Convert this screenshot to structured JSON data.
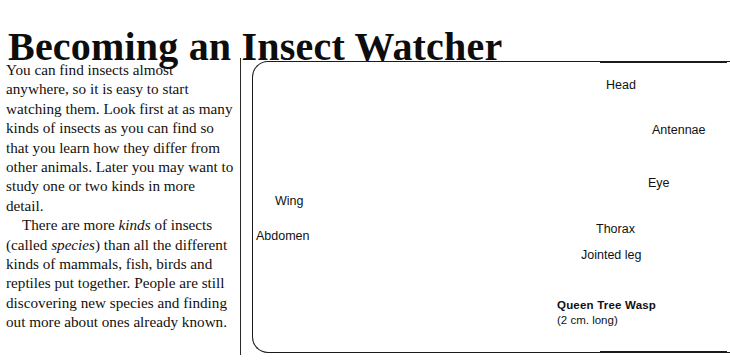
{
  "page": {
    "title": "Becoming an Insect Watcher",
    "background_color": "#ffffff",
    "ink_color": "#111111"
  },
  "article": {
    "paragraph_1_part_1": "You can find insects almost anywhere, so it is easy to start watching them. Look first at as many kinds of insects as you can find so that you learn how they differ from other animals. Later you may want to study one or two kinds in more detail.",
    "paragraph_2_part_1": "There are more ",
    "paragraph_2_em_1": "kinds",
    "paragraph_2_part_2": " of insects (called ",
    "paragraph_2_em_2": "species",
    "paragraph_2_part_3": ") than all the different kinds of mammals, fish, birds and reptiles put together. People are still discovering new species and finding out more about ones already known."
  },
  "illustration": {
    "subject": "queen-tree-wasp-drawing",
    "labels": {
      "head": "Head",
      "antennae": "Antennae",
      "eye": "Eye",
      "thorax": "Thorax",
      "jointed_leg": "Jointed leg",
      "wing": "Wing",
      "abdomen": "Abdomen"
    },
    "caption": {
      "title": "Queen Tree Wasp",
      "size": "(2 cm. long)"
    }
  }
}
